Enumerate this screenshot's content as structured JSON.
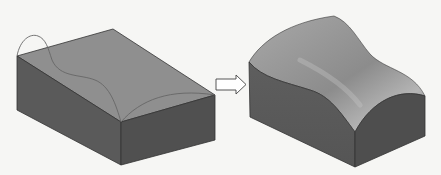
{
  "figure": {
    "colors": {
      "background": "#f6f6f4",
      "top_face": "#8f8f8f",
      "front_face": "#5b5b5b",
      "side_face": "#4f4f4f",
      "edge": "#333333",
      "guide_curve": "#6a6a6a",
      "arrow_fill": "#ffffff",
      "arrow_stroke": "#444444",
      "curved_top_light": "#b9b9b9",
      "curved_top_dark": "#7e7e7e"
    },
    "panels": [
      {
        "id": "before",
        "label": "Block with guide curves"
      },
      {
        "id": "arrow",
        "label": "transform-arrow"
      },
      {
        "id": "after",
        "label": "Resulting curved solid"
      }
    ]
  }
}
